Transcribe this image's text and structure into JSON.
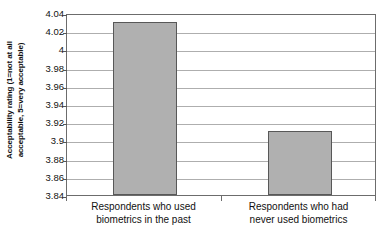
{
  "chart_data": {
    "type": "bar",
    "title": "",
    "subtitle": "",
    "xlabel": "",
    "ylabel": "Acceptability rating (1=not at all acceptable, 5=very acceptable)",
    "ylabel_lines": [
      "Acceptability rating (1=not at all",
      "acceptable, 5=very acceptable)"
    ],
    "categories": [
      "Respondents who used biometrics in the past",
      "Respondents who had never used biometrics"
    ],
    "category_lines": [
      [
        "Respondents who used",
        "biometrics in the past"
      ],
      [
        "Respondents who had",
        "never used biometrics"
      ]
    ],
    "values": [
      4.03,
      3.91
    ],
    "ylim": [
      3.84,
      4.04
    ],
    "ytick_step": 0.02,
    "ytick_labels": [
      "4.04",
      "4.02",
      "4",
      "3.98",
      "3.96",
      "3.94",
      "3.92",
      "3.9",
      "3.88",
      "3.86",
      "3.84"
    ],
    "ytick_values": [
      4.04,
      4.02,
      4.0,
      3.98,
      3.96,
      3.94,
      3.92,
      3.9,
      3.88,
      3.86,
      3.84
    ],
    "grid": "horizontal",
    "legend": "none",
    "bar_fill_color": "#b0b0b0",
    "bar_border_color": "#585858",
    "gridline_color": "#aeaeae",
    "axis_color": "#6c6c6c",
    "plot_background": "#ffffff"
  }
}
